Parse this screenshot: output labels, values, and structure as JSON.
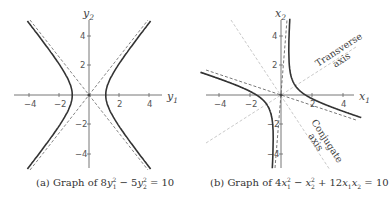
{
  "chart_data": [
    {
      "type": "line",
      "panel": "a",
      "title": "(a) Graph of 8y₁² − 5y₂² = 10",
      "equation": "8*y1^2 - 5*y2^2 = 10",
      "xlabel": "y1",
      "ylabel": "y2",
      "xlim": [
        -5,
        5
      ],
      "ylim": [
        -5,
        5
      ],
      "xticks": [
        -4,
        -2,
        2,
        4
      ],
      "yticks": [
        -4,
        -2,
        2,
        4
      ],
      "grid": false,
      "series": [
        {
          "name": "hyperbola",
          "style": "solid",
          "description": "branches opening left/right, vertices at y1 = ±1.118"
        },
        {
          "name": "asymptote 1",
          "style": "dashed",
          "equation": "y2 = 1.265*y1"
        },
        {
          "name": "asymptote 2",
          "style": "dashed",
          "equation": "y2 = -1.265*y1"
        }
      ]
    },
    {
      "type": "line",
      "panel": "b",
      "title": "(b) Graph of 4x₁² − x₂² + 12x₁x₂ = 10",
      "equation": "4*x1^2 - x2^2 + 12*x1*x2 = 10",
      "xlabel": "x1",
      "ylabel": "x2",
      "xlim": [
        -5,
        5
      ],
      "ylim": [
        -5,
        5
      ],
      "xticks": [
        -4,
        -2,
        2,
        4
      ],
      "yticks": [
        -4,
        -2,
        2,
        4
      ],
      "grid": false,
      "annotations": [
        "Transverse axis",
        "Conjugate axis"
      ],
      "series": [
        {
          "name": "hyperbola",
          "style": "solid",
          "description": "rotated hyperbola, x2 = 6*x1 ± sqrt(40*x1^2 - 10)"
        },
        {
          "name": "asymptote 1",
          "style": "dashed",
          "equation": "x2 = 12.32*x1"
        },
        {
          "name": "asymptote 2",
          "style": "dashed",
          "equation": "x2 = -0.325*x1"
        },
        {
          "name": "transverse axis",
          "style": "light dashed",
          "equation": "x2 = 0.618*x1"
        },
        {
          "name": "conjugate axis",
          "style": "light dashed",
          "equation": "x2 = -1.618*x1"
        }
      ]
    }
  ],
  "panel_a": {
    "xlabel": "y",
    "xlabel_sub": "1",
    "ylabel": "y",
    "ylabel_sub": "2",
    "xticks": [
      "−4",
      "−2",
      "2",
      "4"
    ],
    "yticks": [
      "4",
      "2",
      "−2",
      "−4"
    ],
    "caption_prefix": "(a) Graph of 8",
    "caption": "(a) Graph of 8y₁² − 5y₂² = 10"
  },
  "panel_b": {
    "xlabel": "x",
    "xlabel_sub": "1",
    "ylabel": "x",
    "ylabel_sub": "2",
    "xticks": [
      "−4",
      "−2",
      "2",
      "4"
    ],
    "yticks": [
      "4",
      "2",
      "−2",
      "−4"
    ],
    "annotation_transverse_1": "Transverse",
    "annotation_transverse_2": "axis",
    "annotation_conjugate_1": "Conjugate",
    "annotation_conjugate_2": "axis",
    "caption": "(b) Graph of 4x₁² − x₂² + 12x₁x₂ = 10"
  },
  "colors": {
    "curve": "#333333",
    "axis": "#666666",
    "asymptote": "#555555",
    "principal_axis": "#bbbbbb"
  }
}
